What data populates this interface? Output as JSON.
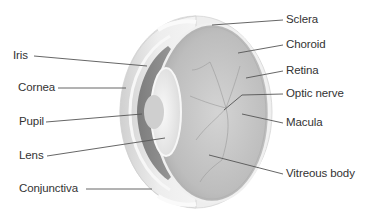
{
  "diagram": {
    "colors": {
      "background": "#ffffff",
      "label_text": "#333333",
      "leader_line": "#555555",
      "sclera": "#e6e6e6",
      "vitreous": "#c9c9c9",
      "iris": "#8f8f8f",
      "lens": "#f2f2f2"
    },
    "labels_left": [
      {
        "id": "iris",
        "text": "Iris"
      },
      {
        "id": "cornea",
        "text": "Cornea"
      },
      {
        "id": "pupil",
        "text": "Pupil"
      },
      {
        "id": "lens",
        "text": "Lens"
      },
      {
        "id": "conjunctiva",
        "text": "Conjunctiva"
      }
    ],
    "labels_right": [
      {
        "id": "sclera",
        "text": "Sclera"
      },
      {
        "id": "choroid",
        "text": "Choroid"
      },
      {
        "id": "retina",
        "text": "Retina"
      },
      {
        "id": "optic-nerve",
        "text": "Optic nerve"
      },
      {
        "id": "macula",
        "text": "Macula"
      },
      {
        "id": "vitreous-body",
        "text": "Vitreous body"
      }
    ]
  }
}
